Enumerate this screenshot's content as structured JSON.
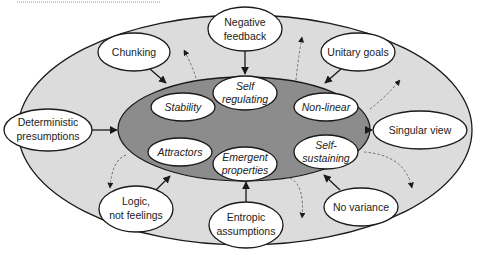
{
  "colors": {
    "outer_ring": "#dcdcdc",
    "inner_core": "#8c8c8c",
    "node_fill": "#ffffff",
    "stroke": "#1a1a1a",
    "dashed": "#6e6e6e"
  },
  "diagram": {
    "outer_nodes": [
      {
        "id": "negative-feedback",
        "lines": [
          "Negative",
          "feedback"
        ]
      },
      {
        "id": "chunking",
        "lines": [
          "Chunking"
        ]
      },
      {
        "id": "unitary-goals",
        "lines": [
          "Unitary goals"
        ]
      },
      {
        "id": "deterministic-presumptions",
        "lines": [
          "Deterministic",
          "presumptions"
        ]
      },
      {
        "id": "singular-view",
        "lines": [
          "Singular view"
        ]
      },
      {
        "id": "logic-not-feelings",
        "lines": [
          "Logic,",
          "not feelings"
        ]
      },
      {
        "id": "entropic-assumptions",
        "lines": [
          "Entropic",
          "assumptions"
        ]
      },
      {
        "id": "no-variance",
        "lines": [
          "No variance"
        ]
      }
    ],
    "inner_nodes": [
      {
        "id": "self-regulating",
        "lines": [
          "Self",
          "regulating"
        ]
      },
      {
        "id": "stability",
        "lines": [
          "Stability"
        ]
      },
      {
        "id": "non-linear",
        "lines": [
          "Non-linear"
        ]
      },
      {
        "id": "attractors",
        "lines": [
          "Attractors"
        ]
      },
      {
        "id": "emergent-properties",
        "lines": [
          "Emergent",
          "properties"
        ]
      },
      {
        "id": "self-sustaining",
        "lines": [
          "Self-",
          "sustaining"
        ]
      }
    ]
  }
}
